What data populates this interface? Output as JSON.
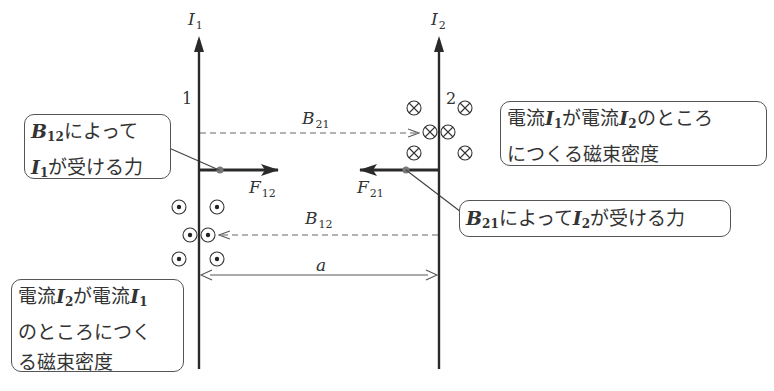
{
  "diagram": {
    "wires": [
      {
        "id": "1",
        "current_label": "I",
        "current_sub": "1",
        "number": "1"
      },
      {
        "id": "2",
        "current_label": "I",
        "current_sub": "2",
        "number": "2"
      }
    ],
    "forces": [
      {
        "label": "F",
        "sub": "12",
        "direction": "right"
      },
      {
        "label": "F",
        "sub": "21",
        "direction": "left"
      }
    ],
    "fields": [
      {
        "label": "B",
        "sub": "21",
        "symbol": "cross-into-page"
      },
      {
        "label": "B",
        "sub": "12",
        "symbol": "dot-out-of-page"
      }
    ],
    "distance_label": "a",
    "callouts": {
      "force_on_I1": {
        "line1_sym": "B",
        "line1_sub": "12",
        "line1_text": "によって",
        "line2_sym": "I",
        "line2_sub": "1",
        "line2_text": "が受ける力"
      },
      "field_by_I1": {
        "t1": "電流",
        "s1": "I",
        "s1_sub": "1",
        "t2": "が電流",
        "s2": "I",
        "s2_sub": "2",
        "t3": "のところ",
        "line2": "につくる磁束密度"
      },
      "force_on_I2": {
        "sym1": "B",
        "sym1_sub": "21",
        "t1": "によって",
        "sym2": "I",
        "sym2_sub": "2",
        "t2": "が受ける力"
      },
      "field_by_I2": {
        "t1": "電流",
        "s1": "I",
        "s1_sub": "2",
        "t2": "が電流",
        "s2": "I",
        "s2_sub": "1",
        "line2": "のところにつく",
        "line3": "る磁束密度"
      }
    },
    "colors": {
      "line": "#2a2a2a",
      "dashed": "#666666",
      "dot": "#666666",
      "border": "#555555"
    }
  }
}
